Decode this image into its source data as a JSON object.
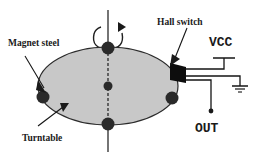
{
  "figure": {
    "background_color": "#ffffff",
    "ink_color": "#141414"
  },
  "labels": {
    "magnet_steel": "Magnet steel",
    "turntable": "Turntable",
    "hall_switch": "Hall switch",
    "vcc": "VCC",
    "out": "OUT"
  },
  "turntable": {
    "fill_color": "#c8c8c8",
    "edge_color": "#2b2b2b",
    "center_x": 108,
    "center_y": 86,
    "radius_x": 70,
    "radius_y": 39
  },
  "magnets": {
    "color": "#2a2a2a",
    "count": 4,
    "positions": [
      {
        "name": "magnet-left",
        "x": 43,
        "y": 97
      },
      {
        "name": "magnet-top",
        "x": 108,
        "y": 48
      },
      {
        "name": "magnet-bottom",
        "x": 108,
        "y": 124
      },
      {
        "name": "magnet-right",
        "x": 172,
        "y": 98
      }
    ]
  },
  "hub": {
    "name": "turntable-hub",
    "x": 108,
    "y": 86,
    "color": "#2a2a2a"
  },
  "shaft": {
    "x": 108,
    "top_y": 10,
    "bottom_y": 152
  },
  "rotation_arrow": {
    "direction": "clockwise"
  },
  "hall_switch_block": {
    "color": "#0d0d0d",
    "x": 170,
    "y": 64,
    "width": 16,
    "height": 18
  },
  "circuit": {
    "vcc_terminal": {
      "x": 224,
      "y": 50
    },
    "ground_symbol": {
      "x": 240,
      "y": 88
    },
    "out_terminal": {
      "x": 211,
      "y": 112
    },
    "wires": [
      {
        "name": "wire-vcc",
        "from": "hall-switch-top",
        "to": "vcc-terminal"
      },
      {
        "name": "wire-ground",
        "from": "hall-switch-middle",
        "to": "ground-symbol"
      },
      {
        "name": "wire-out",
        "from": "hall-switch-bottom",
        "to": "out-terminal"
      }
    ]
  }
}
